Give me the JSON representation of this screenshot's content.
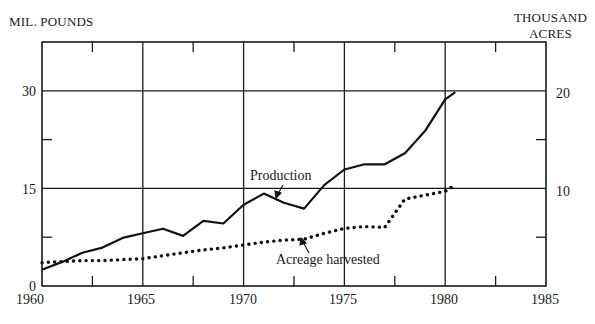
{
  "chart_data": {
    "type": "line",
    "title": "",
    "xlabel": "",
    "ylabel": "MIL. POUNDS",
    "ylabel_right": [
      "THOUSAND",
      "ACRES"
    ],
    "xlim": [
      1960,
      1985
    ],
    "ylim": [
      0,
      37.5
    ],
    "ylim_right": [
      0,
      25
    ],
    "x_ticks": [
      "1960",
      "1965",
      "1970",
      "1975",
      "1980",
      "1985"
    ],
    "y_ticks_left": [
      "0",
      "15",
      "30"
    ],
    "y_ticks_right": [
      "10",
      "20"
    ],
    "grid": {
      "vertical_years": [
        1965,
        1970,
        1975,
        1980
      ],
      "horizontal_left_values": [
        15,
        30
      ]
    },
    "legend_position": "inline annotations",
    "series": [
      {
        "name": "Production",
        "axis": "left",
        "unit": "million pounds",
        "style": "solid",
        "x": [
          1960,
          1961,
          1962,
          1963,
          1964,
          1965,
          1966,
          1967,
          1968,
          1969,
          1970,
          1971,
          1972,
          1973,
          1974,
          1975,
          1976,
          1977,
          1978,
          1979,
          1980,
          1980.5
        ],
        "values": [
          2.5,
          3.7,
          5.1,
          5.9,
          7.4,
          8.1,
          8.8,
          7.7,
          10.0,
          9.6,
          12.5,
          14.2,
          12.8,
          11.9,
          15.5,
          17.9,
          18.7,
          18.7,
          20.4,
          23.8,
          28.7,
          29.8
        ]
      },
      {
        "name": "Acreage harvested",
        "axis": "right",
        "unit": "thousand acres",
        "style": "dotted",
        "x": [
          1960,
          1961,
          1962,
          1963,
          1964,
          1965,
          1966,
          1967,
          1968,
          1969,
          1970,
          1971,
          1972,
          1973,
          1974,
          1975,
          1976,
          1977,
          1978,
          1979,
          1980,
          1980.3
        ],
        "values": [
          2.4,
          2.5,
          2.6,
          2.6,
          2.7,
          2.8,
          3.1,
          3.4,
          3.7,
          3.9,
          4.2,
          4.5,
          4.7,
          4.8,
          5.4,
          5.9,
          6.1,
          6.0,
          8.9,
          9.3,
          9.7,
          10.1
        ]
      }
    ],
    "annotations": [
      {
        "text": "Production",
        "points_to_year": 1971.7
      },
      {
        "text": "Acreage harvested",
        "points_to_year": 1973
      }
    ]
  },
  "labels": {
    "left_axis": "MIL. POUNDS",
    "right_axis_line1": "THOUSAND",
    "right_axis_line2": "ACRES",
    "production": "Production",
    "acreage": "Acreage harvested"
  },
  "ticks": {
    "left": [
      "0",
      "15",
      "30"
    ],
    "right": [
      "10",
      "20"
    ],
    "x": [
      "1960",
      "1965",
      "1970",
      "1975",
      "1980",
      "1985"
    ]
  }
}
